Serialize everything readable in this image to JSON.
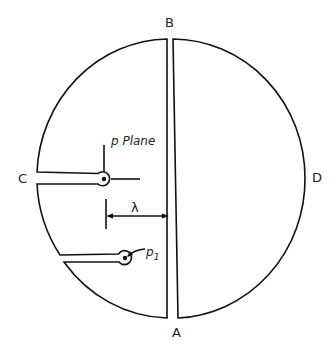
{
  "diagram": {
    "type": "cut circular plane (Riemann-surface style) with slits",
    "labels": {
      "top": "B",
      "bottom": "A",
      "left": "C",
      "right": "D",
      "plane": "p Plane",
      "distance": "λ",
      "point_p1": "p",
      "point_p1_sub": "1"
    },
    "colors": {
      "line": "#111111",
      "background": "#ffffff"
    }
  }
}
